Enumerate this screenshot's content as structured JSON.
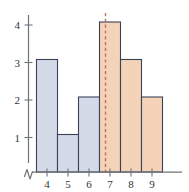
{
  "chart_data": {
    "type": "bar",
    "title": "",
    "subtitle": "",
    "xlabel": "",
    "ylabel": "",
    "categories": [
      "4",
      "5",
      "6",
      "7",
      "8",
      "9"
    ],
    "values": [
      3,
      1,
      2,
      4,
      3,
      2
    ],
    "series": [
      {
        "name": "frequency",
        "values": [
          3,
          1,
          2,
          4,
          3,
          2
        ]
      }
    ],
    "bar_colors": [
      "#d5dae9",
      "#d5dae9",
      "#d5dae9",
      "#f4d3b8",
      "#f4d3b8",
      "#f4d3b8"
    ],
    "bar_outline_color": "#3a4258",
    "xlim": [
      3.5,
      9.5
    ],
    "ylim": [
      0,
      4.35
    ],
    "x_ticks": [
      "4",
      "5",
      "6",
      "7",
      "8",
      "9"
    ],
    "y_ticks": [
      "1",
      "2",
      "3",
      "4"
    ],
    "y_tick_values": [
      1,
      2,
      3,
      4
    ],
    "grid": false,
    "legend": false,
    "legend_position": "none",
    "annotations": [
      {
        "name": "median-line",
        "type": "vertical-dashed-line",
        "x_value": 6.75,
        "color": "#c2705a",
        "label": ""
      },
      {
        "name": "y-axis-break",
        "type": "axis-break",
        "label": ""
      }
    ]
  },
  "axes": {
    "y_axis": {
      "name": "y-axis",
      "ticks": [
        {
          "label": "4",
          "value": 4
        },
        {
          "label": "3",
          "value": 3
        },
        {
          "label": "2",
          "value": 2
        },
        {
          "label": "1",
          "value": 1
        }
      ]
    },
    "x_axis": {
      "name": "x-axis",
      "ticks": [
        {
          "label": "4",
          "value": 4
        },
        {
          "label": "5",
          "value": 5
        },
        {
          "label": "6",
          "value": 6
        },
        {
          "label": "7",
          "value": 7
        },
        {
          "label": "8",
          "value": 8
        },
        {
          "label": "9",
          "value": 9
        }
      ]
    }
  },
  "colors": {
    "bar_blue_fill": "#d5dae9",
    "bar_orange_fill": "#f4d3b8",
    "bar_stroke": "#3a4258",
    "axis": "#6f7479",
    "dashed_line": "#c2705a",
    "tick_text": "#2f3338",
    "background": "#ffffff"
  }
}
